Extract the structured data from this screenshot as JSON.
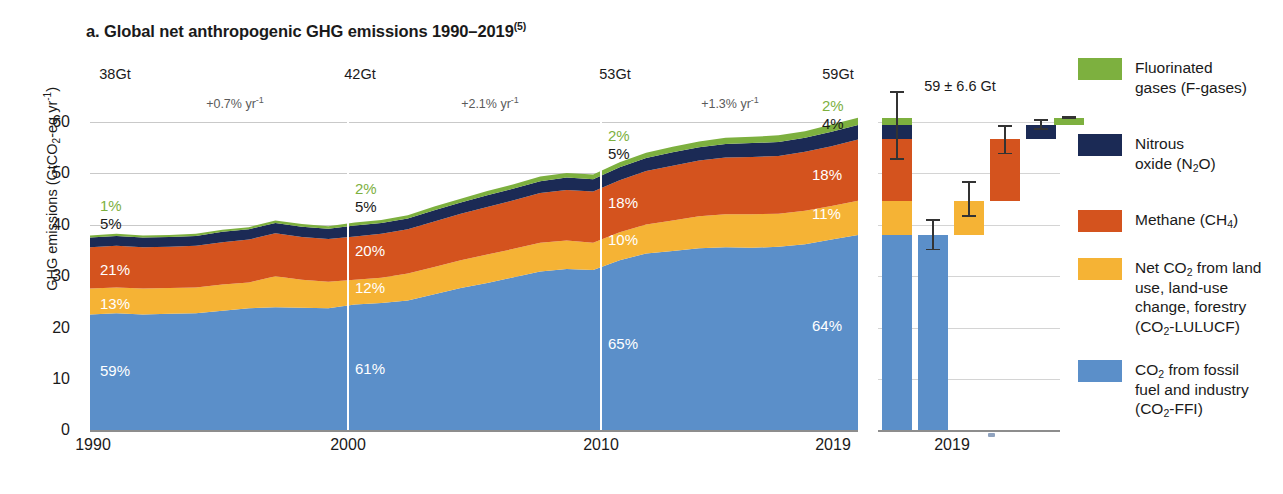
{
  "title": {
    "main": "a. Global net anthropogenic GHG emissions 1990–2019",
    "note": "(5)"
  },
  "axes": {
    "ylabel_pre": "GHG emissions (GtCO",
    "ylabel_sub": "2",
    "ylabel_mid": "-eq yr",
    "ylabel_sup": "-1",
    "ylabel_post": ")",
    "yticks": [
      "60",
      "50",
      "40",
      "30",
      "20",
      "10",
      "0"
    ],
    "xticks": [
      "1990",
      "2000",
      "2010",
      "2019"
    ],
    "bar_xtick": "2019"
  },
  "annotations": {
    "gt_labels": [
      "38Gt",
      "42Gt",
      "53Gt",
      "59Gt"
    ],
    "rates": [
      "+0.7% yr",
      "+2.1% yr",
      "+1.3% yr"
    ],
    "rate_sup": "-1",
    "bar_total": "59 ± 6.6 Gt"
  },
  "percent_labels": {
    "y1990": [
      "1%",
      "5%",
      "21%",
      "13%",
      "59%"
    ],
    "y2000": [
      "2%",
      "5%",
      "20%",
      "12%",
      "61%"
    ],
    "y2010": [
      "2%",
      "5%",
      "18%",
      "10%",
      "65%"
    ],
    "y2019": [
      "2%",
      "4%",
      "18%",
      "11%",
      "64%"
    ]
  },
  "legend": {
    "items": [
      {
        "name": "f-gases",
        "color": "#7DB03F",
        "line1": "Fluorinated",
        "line2": "gases (F-gases)",
        "line3": ""
      },
      {
        "name": "n2o",
        "color": "#1B2A55",
        "line1": "Nitrous",
        "line2_pre": "oxide (N",
        "line2_sub": "2",
        "line2_post": "O)",
        "line3": ""
      },
      {
        "name": "methane",
        "color": "#D4531E",
        "line1_pre": "Methane (CH",
        "line1_sub": "4",
        "line1_post": ")"
      },
      {
        "name": "lulucf",
        "color": "#F5B335",
        "l1_pre": "Net CO",
        "l1_sub": "2",
        "l1_post": " from land",
        "l2": "use, land-use",
        "l3": "change, forestry",
        "l4_pre": "(CO",
        "l4_sub": "2",
        "l4_post": "-LULUCF)"
      },
      {
        "name": "co2-ffi",
        "color": "#5B8FC9",
        "l1_pre": "CO",
        "l1_sub": "2",
        "l1_post": " from fossil",
        "l2": "fuel and industry",
        "l3_pre": "(CO",
        "l3_sub": "2",
        "l3_post": "-FFI)"
      }
    ]
  },
  "chart_data": {
    "type": "area",
    "title": "a. Global net anthropogenic GHG emissions 1990–2019",
    "xlabel": "",
    "ylabel": "GHG emissions (GtCO2-eq yr-1)",
    "ylim": [
      0,
      62
    ],
    "xlim": [
      1990,
      2019
    ],
    "grid": true,
    "legend_position": "right",
    "stack_order_bottom_to_top": [
      "CO2-FFI",
      "CO2-LULUCF",
      "Methane (CH4)",
      "Nitrous oxide (N2O)",
      "F-gases"
    ],
    "colors": {
      "CO2-FFI": "#5B8FC9",
      "CO2-LULUCF": "#F5B335",
      "Methane (CH4)": "#D4531E",
      "Nitrous oxide (N2O)": "#1B2A55",
      "F-gases": "#7DB03F"
    },
    "x": [
      1990,
      1991,
      1992,
      1993,
      1994,
      1995,
      1996,
      1997,
      1998,
      1999,
      2000,
      2001,
      2002,
      2003,
      2004,
      2005,
      2006,
      2007,
      2008,
      2009,
      2010,
      2011,
      2012,
      2013,
      2014,
      2015,
      2016,
      2017,
      2018,
      2019
    ],
    "series": [
      {
        "name": "CO2-FFI",
        "values": [
          22.4,
          22.6,
          22.4,
          22.5,
          22.6,
          23.1,
          23.6,
          23.8,
          23.7,
          23.6,
          24.3,
          24.6,
          25.1,
          26.3,
          27.5,
          28.5,
          29.6,
          30.7,
          31.2,
          31.0,
          32.9,
          34.2,
          34.7,
          35.2,
          35.4,
          35.3,
          35.5,
          36.0,
          36.9,
          37.8
        ],
        "unit": "GtCO2-eq yr-1"
      },
      {
        "name": "CO2-LULUCF",
        "values": [
          5.0,
          5.0,
          5.0,
          5.0,
          5.0,
          5.1,
          5.0,
          6.0,
          5.4,
          5.1,
          4.8,
          4.9,
          5.2,
          5.3,
          5.4,
          5.5,
          5.5,
          5.6,
          5.5,
          5.3,
          5.4,
          5.6,
          5.9,
          6.2,
          6.4,
          6.5,
          6.4,
          6.5,
          6.5,
          6.6
        ],
        "unit": "GtCO2-eq yr-1"
      },
      {
        "name": "Methane (CH4)",
        "values": [
          8.0,
          8.1,
          8.0,
          8.0,
          8.1,
          8.2,
          8.3,
          8.3,
          8.3,
          8.3,
          8.4,
          8.5,
          8.6,
          8.8,
          9.0,
          9.2,
          9.4,
          9.6,
          9.8,
          9.9,
          10.1,
          10.4,
          10.6,
          10.8,
          11.0,
          11.1,
          11.2,
          11.4,
          11.6,
          11.9
        ],
        "unit": "GtCO2-eq yr-1"
      },
      {
        "name": "Nitrous oxide (N2O)",
        "values": [
          1.9,
          1.9,
          1.9,
          1.9,
          1.9,
          2.0,
          2.0,
          2.0,
          2.0,
          2.0,
          2.1,
          2.1,
          2.1,
          2.2,
          2.2,
          2.3,
          2.3,
          2.3,
          2.4,
          2.4,
          2.5,
          2.5,
          2.6,
          2.6,
          2.6,
          2.7,
          2.7,
          2.7,
          2.8,
          2.8
        ],
        "unit": "GtCO2-eq yr-1"
      },
      {
        "name": "F-gases",
        "values": [
          0.4,
          0.4,
          0.4,
          0.4,
          0.4,
          0.4,
          0.4,
          0.5,
          0.5,
          0.5,
          0.6,
          0.6,
          0.6,
          0.7,
          0.7,
          0.8,
          0.8,
          0.9,
          0.9,
          0.9,
          1.0,
          1.0,
          1.1,
          1.1,
          1.2,
          1.2,
          1.3,
          1.3,
          1.4,
          1.4
        ],
        "unit": "GtCO2-eq yr-1"
      }
    ],
    "totals_labeled": {
      "1990": 38,
      "2000": 42,
      "2010": 53,
      "2019": 59
    },
    "growth_rates": [
      {
        "period": "1990-2000",
        "value": "+0.7% yr-1"
      },
      {
        "period": "2000-2010",
        "value": "+2.1% yr-1"
      },
      {
        "period": "2010-2019",
        "value": "+1.3% yr-1"
      }
    ],
    "share_labels": {
      "1990": {
        "F-gases": "1%",
        "N2O": "5%",
        "CH4": "21%",
        "CO2-LULUCF": "13%",
        "CO2-FFI": "59%"
      },
      "2000": {
        "F-gases": "2%",
        "N2O": "5%",
        "CH4": "20%",
        "CO2-LULUCF": "12%",
        "CO2-FFI": "61%"
      },
      "2010": {
        "F-gases": "2%",
        "N2O": "5%",
        "CH4": "18%",
        "CO2-LULUCF": "10%",
        "CO2-FFI": "65%"
      },
      "2019": {
        "F-gases": "2%",
        "N2O": "4%",
        "CH4": "18%",
        "CO2-LULUCF": "11%",
        "CO2-FFI": "64%"
      }
    },
    "inset_bar_chart": {
      "type": "bar",
      "year": 2019,
      "total_label": "59 ± 6.6 Gt",
      "bars": [
        {
          "name": "Total (stacked)",
          "value": 59,
          "err_low": 52.4,
          "err_high": 65.6,
          "stacked": true
        },
        {
          "name": "CO2-FFI",
          "value": 37.8,
          "err_low": 34.8,
          "err_high": 40.8,
          "color": "#5B8FC9"
        },
        {
          "name": "CO2-LULUCF",
          "value": 6.6,
          "err_low": 3.5,
          "err_high": 10.4,
          "color": "#F5B335",
          "floating_base": 37.8
        },
        {
          "name": "Methane (CH4)",
          "value": 11.9,
          "err_low": 9.0,
          "err_high": 14.6,
          "color": "#D4531E",
          "floating_base": 44.4
        },
        {
          "name": "Nitrous oxide (N2O)",
          "value": 2.8,
          "err_low": 1.9,
          "err_high": 3.9,
          "color": "#1B2A55",
          "floating_base": 56.3
        },
        {
          "name": "F-gases",
          "value": 1.4,
          "err_low": 1.1,
          "err_high": 1.7,
          "color": "#7DB03F",
          "floating_base": 59.1
        }
      ]
    }
  }
}
